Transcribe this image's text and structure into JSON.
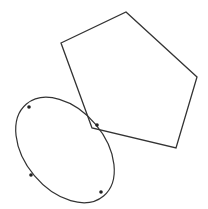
{
  "diagram": {
    "background": "#ffffff",
    "stroke_color": "#333333",
    "point_color": "#222222",
    "pentagon": {
      "points": [
        [
          126,
          12
        ],
        [
          197,
          77
        ],
        [
          176,
          148
        ],
        [
          92,
          128
        ],
        [
          61,
          43
        ]
      ]
    },
    "ellipse": {
      "cx": 65,
      "cy": 150,
      "rx": 60,
      "ry": 40,
      "rotation_deg": 50,
      "marked_points": [
        [
          29,
          107
        ],
        [
          97,
          125
        ],
        [
          31,
          175
        ],
        [
          101,
          192
        ]
      ]
    }
  }
}
